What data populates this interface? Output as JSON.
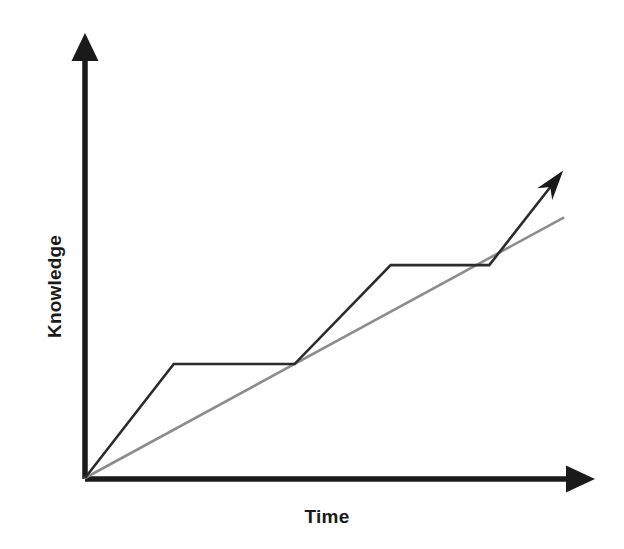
{
  "chart_data": {
    "type": "line",
    "title": "",
    "subtitle": "",
    "xlabel": "Time",
    "ylabel": "Knowledge",
    "grid": false,
    "legend": null,
    "axes": {
      "x_axis_label": "Time",
      "y_axis_label": "Knowledge",
      "x_ticks": [],
      "y_ticks": [],
      "xlim": [
        0,
        10
      ],
      "ylim": [
        0,
        10
      ],
      "x_arrow": true,
      "y_arrow": true,
      "description": "Unlabeled qualitative axes with arrowheads; no tick marks, no numeric scale, no gridlines."
    },
    "series": [
      {
        "name": "Actual learning (stepped plateau curve)",
        "color": "#2b2b2b",
        "style": "solid",
        "width": 2,
        "arrow_end": true,
        "points": [
          {
            "x": 0.0,
            "y": 0.0
          },
          {
            "x": 1.8,
            "y": 2.65
          },
          {
            "x": 4.25,
            "y": 2.65
          },
          {
            "x": 6.2,
            "y": 4.95
          },
          {
            "x": 8.2,
            "y": 4.95
          },
          {
            "x": 9.7,
            "y": 7.15
          }
        ],
        "note": "Rise, plateau, rise, plateau, rise with arrowhead at the end"
      },
      {
        "name": "Expected linear progress (reference line)",
        "color": "#8c8c8c",
        "style": "solid",
        "width": 2,
        "arrow_end": false,
        "points": [
          {
            "x": 0.0,
            "y": 0.0
          },
          {
            "x": 9.7,
            "y": 6.05
          }
        ],
        "note": "Straight line from origin used as a constant-rate comparison"
      }
    ],
    "annotations": [],
    "colors": {
      "axis": "#1a1a1a",
      "stepped_line": "#2b2b2b",
      "reference_line": "#8c8c8c",
      "background": "#ffffff",
      "label_text": "#1a1a1a"
    }
  },
  "labels": {
    "y_axis": "Knowledge",
    "x_axis": "Time"
  },
  "icons": {
    "y_axis_arrow": "arrow-up-icon",
    "x_axis_arrow": "arrow-right-icon",
    "curve_arrow": "arrow-up-right-icon"
  }
}
